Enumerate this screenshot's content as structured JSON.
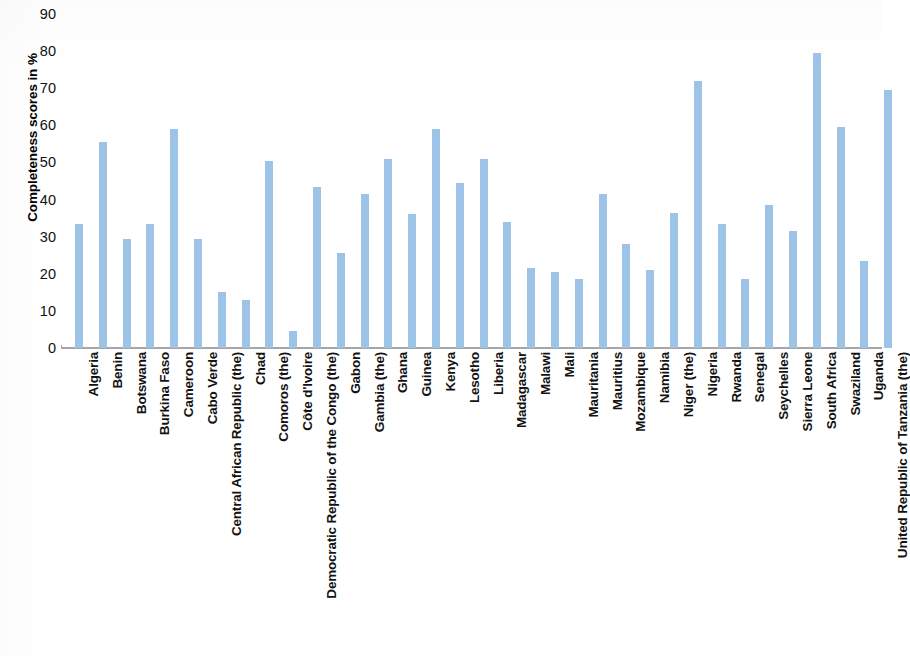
{
  "chart_data": {
    "type": "bar",
    "title": "",
    "xlabel": "",
    "ylabel": "Completeness scores in %",
    "ylim": [
      0,
      90
    ],
    "yticks": [
      90,
      80,
      70,
      60,
      50,
      40,
      30,
      20,
      10,
      0
    ],
    "grid": false,
    "legend": null,
    "bar_color": "#9dc3e6",
    "axis_color": "#a6a6a6",
    "categories": [
      "Algeria",
      "Benin",
      "Botswana",
      "Burkina Faso",
      "Cameroon",
      "Cabo Verde",
      "Central African Republic (the)",
      "Chad",
      "Comoros (the)",
      "Côte d'Ivoire",
      "Democratic Republic of the Congo (the)",
      "Gabon",
      "Gambia (the)",
      "Ghana",
      "Guinea",
      "Kenya",
      "Lesotho",
      "Liberia",
      "Madagascar",
      "Malawi",
      "Mali",
      "Mauritania",
      "Mauritius",
      "Mozambique",
      "Namibia",
      "Niger (the)",
      "Nigeria",
      "Rwanda",
      "Senegal",
      "Seychelles",
      "Sierra Leone",
      "South Africa",
      "Swaziland",
      "Uganda",
      "United Republic of Tanzania (the)"
    ],
    "values": [
      33.5,
      55.5,
      29.5,
      33.5,
      59,
      29.5,
      15,
      13,
      50.5,
      4.5,
      43.5,
      25.5,
      41.5,
      51,
      36,
      59,
      44.5,
      51,
      34,
      21.5,
      20.5,
      18.5,
      41.5,
      28,
      21,
      36.5,
      72,
      33.5,
      18.5,
      38.5,
      31.5,
      79.5,
      59.5,
      23.5,
      69.5
    ]
  }
}
